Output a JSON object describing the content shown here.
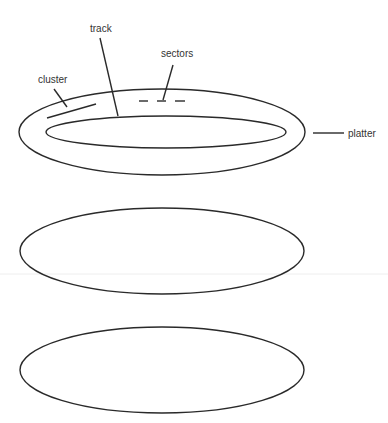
{
  "diagram": {
    "labels": {
      "track": "track",
      "sectors": "sectors",
      "cluster": "cluster",
      "platter": "platter"
    },
    "platters": [
      {
        "name": "platter-top",
        "annotated": true
      },
      {
        "name": "platter-middle",
        "annotated": false
      },
      {
        "name": "platter-bottom",
        "annotated": false
      }
    ],
    "colors": {
      "line": "#2a2a2a",
      "text": "#333333",
      "background": "#ffffff"
    }
  }
}
